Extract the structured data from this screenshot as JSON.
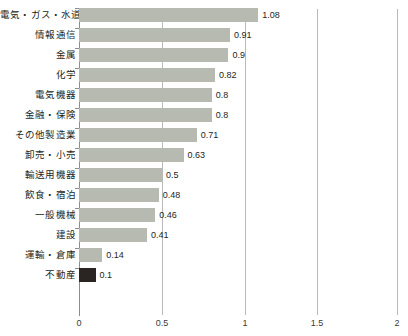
{
  "chart_data": {
    "type": "bar",
    "orientation": "horizontal",
    "title": "",
    "subtitle": "",
    "xlabel": "",
    "ylabel": "",
    "xlim": [
      0,
      2
    ],
    "xticks": [
      "0",
      "0.5",
      "1",
      "1.5",
      "2"
    ],
    "xtick_values": [
      0,
      0.5,
      1,
      1.5,
      2
    ],
    "grid": true,
    "legend": "none",
    "categories": [
      "電気・ガス・水道",
      "情報通信",
      "金属",
      "化学",
      "電気機器",
      "金融・保険",
      "その他製造業",
      "卸売・小売",
      "輸送用機器",
      "飲食・宿泊",
      "一般機械",
      "建設",
      "運輸・倉庫",
      "不動産"
    ],
    "values": [
      1.08,
      0.91,
      0.9,
      0.82,
      0.8,
      0.8,
      0.71,
      0.63,
      0.5,
      0.48,
      0.46,
      0.41,
      0.14,
      0.1
    ],
    "value_labels": [
      "1.08",
      "0.91",
      "0.9",
      "0.82",
      "0.8",
      "0.8",
      "0.71",
      "0.63",
      "0.5",
      "0.48",
      "0.46",
      "0.41",
      "0.14",
      "0.1"
    ],
    "highlight_index": 13,
    "colors": {
      "bar": "#b6bab1",
      "bar_highlight": "#2a2522",
      "gridline": "#b9b9b9",
      "axis": "#8d8d8d",
      "text": "#231f20",
      "background": "#ffffff"
    }
  }
}
